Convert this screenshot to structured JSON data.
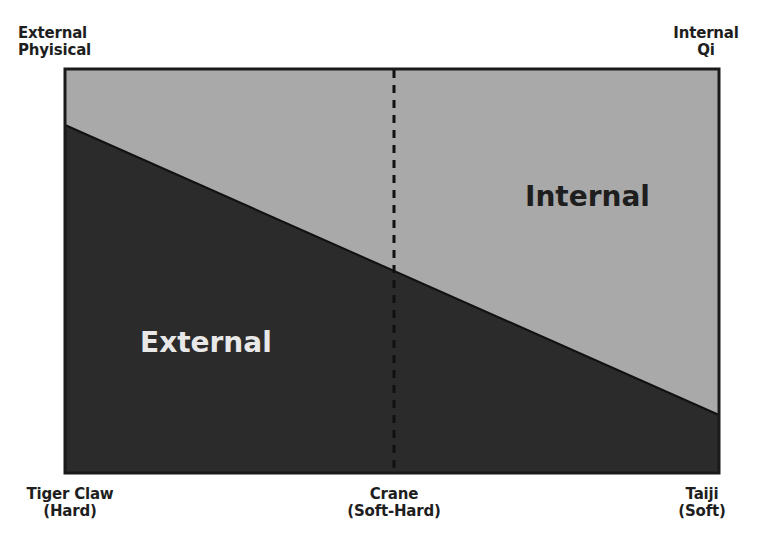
{
  "diagram": {
    "corner_labels": {
      "top_left": [
        "External",
        "Phyisical"
      ],
      "top_right": [
        "Internal",
        "Qi"
      ]
    },
    "axis_labels": [
      {
        "line1": "Tiger Claw",
        "line2": "(Hard)"
      },
      {
        "line1": "Crane",
        "line2": "(Soft-Hard)"
      },
      {
        "line1": "Taiji",
        "line2": "(Soft)"
      }
    ],
    "regions": {
      "internal": "Internal",
      "external": "External"
    },
    "colors": {
      "internal_fill": "#a9a9a9",
      "external_fill": "#2b2b2b",
      "border": "#1a1a1a",
      "internal_text": "#1e1e1e",
      "external_text": "#e8e8e8"
    }
  }
}
